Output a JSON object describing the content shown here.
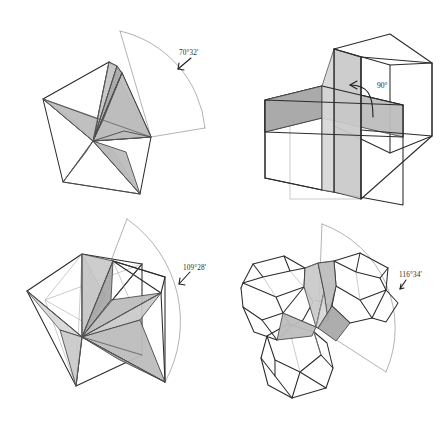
{
  "figure": {
    "width": 446,
    "height": 421,
    "background_color": "#ffffff",
    "stroke_color": "#2b2b2b",
    "shade_color": "#bdbdbd",
    "arc_color": "#9a9a9a"
  },
  "panels": [
    {
      "id": "tetrahedra",
      "position": "top-left",
      "solid_name": "tetrahedron",
      "copies_around_edge": 5,
      "angle_label": "70°32'",
      "angle_degrees": 70,
      "angle_minutes": 32,
      "gap_present": true
    },
    {
      "id": "cubes",
      "position": "top-right",
      "solid_name": "cube",
      "copies_around_edge": 4,
      "angle_label": "90°",
      "angle_degrees": 90,
      "angle_minutes": 0,
      "gap_present": false
    },
    {
      "id": "octahedra",
      "position": "bottom-left",
      "solid_name": "octahedron",
      "copies_around_edge": 3,
      "angle_label": "109°28'",
      "angle_degrees": 109,
      "angle_minutes": 28,
      "gap_present": true
    },
    {
      "id": "dodecahedra",
      "position": "bottom-right",
      "solid_name": "dodecahedron",
      "copies_around_edge": 3,
      "angle_label": "116°34'",
      "angle_degrees": 116,
      "angle_minutes": 34,
      "gap_present": true
    }
  ]
}
